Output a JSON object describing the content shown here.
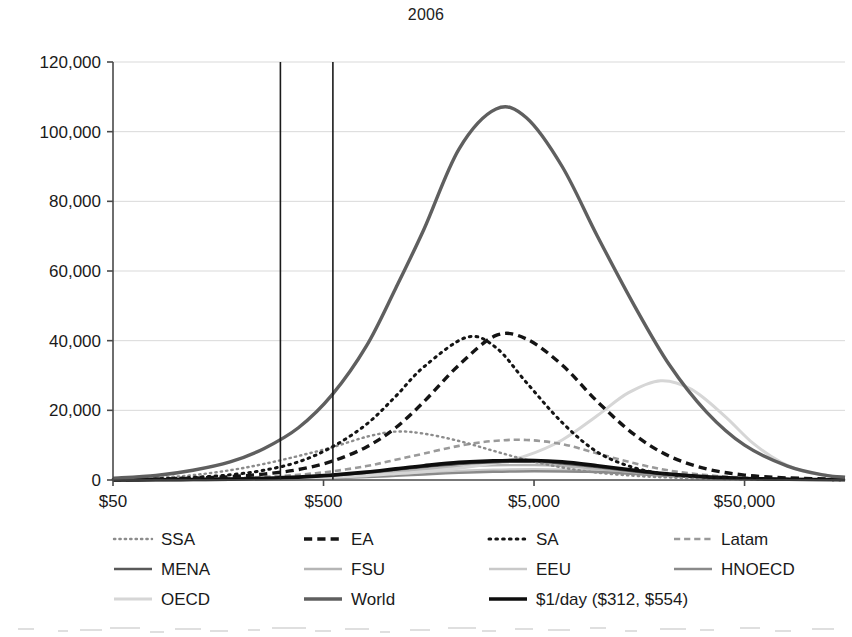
{
  "chart_data": {
    "type": "line",
    "title": "2006",
    "xlabel": "",
    "ylabel": "",
    "x_scale": "log",
    "xlim": [
      50,
      150000
    ],
    "ylim": [
      0,
      120000
    ],
    "grid": "horizontal",
    "legend_position": "bottom",
    "x_tick_labels": [
      "$50",
      "$500",
      "$5,000",
      "$50,000"
    ],
    "x_tick_values": [
      50,
      500,
      5000,
      50000
    ],
    "y_tick_labels": [
      "0",
      "20,000",
      "40,000",
      "60,000",
      "80,000",
      "100,000",
      "120,000"
    ],
    "y_tick_values": [
      0,
      20000,
      40000,
      60000,
      80000,
      100000,
      120000
    ],
    "annotations": [
      {
        "name": "poverty-line-low",
        "label": "$312",
        "x": 312,
        "style": "vertical-line",
        "color": "#1a1a1a"
      },
      {
        "name": "poverty-line-high",
        "label": "$554",
        "x": 554,
        "style": "vertical-line",
        "color": "#1a1a1a"
      }
    ],
    "series": [
      {
        "name": "SSA",
        "label": "SSA",
        "style": "dotted",
        "color": "#8c8c8c",
        "width": 2.4,
        "peak_x": 900,
        "peak_y": 14000,
        "points": [
          [
            50,
            200
          ],
          [
            80,
            600
          ],
          [
            120,
            1400
          ],
          [
            180,
            2800
          ],
          [
            260,
            4600
          ],
          [
            380,
            6900
          ],
          [
            550,
            9400
          ],
          [
            800,
            12400
          ],
          [
            1100,
            13900
          ],
          [
            1500,
            13300
          ],
          [
            2200,
            11200
          ],
          [
            3200,
            8400
          ],
          [
            4600,
            5800
          ],
          [
            6800,
            3600
          ],
          [
            10000,
            2100
          ],
          [
            15000,
            1200
          ],
          [
            22000,
            700
          ],
          [
            33000,
            400
          ],
          [
            50000,
            220
          ],
          [
            80000,
            120
          ],
          [
            150000,
            60
          ]
        ]
      },
      {
        "name": "EA",
        "label": "EA",
        "style": "dashed",
        "color": "#141414",
        "width": 3.4,
        "peak_x": 3300,
        "peak_y": 41500,
        "points": [
          [
            50,
            100
          ],
          [
            80,
            250
          ],
          [
            120,
            500
          ],
          [
            180,
            950
          ],
          [
            260,
            1700
          ],
          [
            380,
            3000
          ],
          [
            550,
            5400
          ],
          [
            800,
            9500
          ],
          [
            1100,
            15000
          ],
          [
            1500,
            22500
          ],
          [
            2200,
            33000
          ],
          [
            3300,
            41500
          ],
          [
            4600,
            40500
          ],
          [
            6800,
            33000
          ],
          [
            10000,
            22500
          ],
          [
            15000,
            13000
          ],
          [
            22000,
            6800
          ],
          [
            33000,
            3200
          ],
          [
            50000,
            1400
          ],
          [
            80000,
            600
          ],
          [
            150000,
            200
          ]
        ]
      },
      {
        "name": "SA",
        "label": "SA",
        "style": "dotted",
        "color": "#141414",
        "width": 3.0,
        "peak_x": 2400,
        "peak_y": 41000,
        "points": [
          [
            50,
            150
          ],
          [
            80,
            350
          ],
          [
            120,
            750
          ],
          [
            180,
            1500
          ],
          [
            260,
            2800
          ],
          [
            380,
            5200
          ],
          [
            550,
            9500
          ],
          [
            800,
            16000
          ],
          [
            1100,
            24000
          ],
          [
            1500,
            32500
          ],
          [
            2400,
            41000
          ],
          [
            3300,
            38000
          ],
          [
            4600,
            28000
          ],
          [
            6800,
            16500
          ],
          [
            10000,
            8000
          ],
          [
            15000,
            3500
          ],
          [
            22000,
            1600
          ],
          [
            33000,
            800
          ],
          [
            50000,
            400
          ],
          [
            80000,
            200
          ],
          [
            150000,
            80
          ]
        ]
      },
      {
        "name": "Latam",
        "label": "Latam",
        "style": "dashed",
        "color": "#9a9a9a",
        "width": 2.6,
        "peak_x": 4000,
        "peak_y": 11500,
        "points": [
          [
            50,
            60
          ],
          [
            80,
            140
          ],
          [
            120,
            280
          ],
          [
            180,
            520
          ],
          [
            260,
            900
          ],
          [
            380,
            1500
          ],
          [
            550,
            2500
          ],
          [
            800,
            4000
          ],
          [
            1100,
            5800
          ],
          [
            1500,
            7600
          ],
          [
            2200,
            9800
          ],
          [
            3200,
            11200
          ],
          [
            4600,
            11500
          ],
          [
            6800,
            10300
          ],
          [
            10000,
            7600
          ],
          [
            15000,
            4800
          ],
          [
            22000,
            2700
          ],
          [
            33000,
            1400
          ],
          [
            50000,
            700
          ],
          [
            80000,
            320
          ],
          [
            150000,
            120
          ]
        ]
      },
      {
        "name": "MENA",
        "label": "MENA",
        "style": "solid",
        "color": "#595959",
        "width": 2.4,
        "peak_x": 5000,
        "peak_y": 5200,
        "points": [
          [
            50,
            30
          ],
          [
            80,
            70
          ],
          [
            120,
            140
          ],
          [
            180,
            270
          ],
          [
            260,
            480
          ],
          [
            380,
            820
          ],
          [
            550,
            1350
          ],
          [
            800,
            2100
          ],
          [
            1100,
            2900
          ],
          [
            1500,
            3700
          ],
          [
            2200,
            4600
          ],
          [
            3200,
            5100
          ],
          [
            5000,
            5200
          ],
          [
            6800,
            4700
          ],
          [
            10000,
            3700
          ],
          [
            15000,
            2400
          ],
          [
            22000,
            1400
          ],
          [
            33000,
            750
          ],
          [
            50000,
            380
          ],
          [
            80000,
            170
          ],
          [
            150000,
            70
          ]
        ]
      },
      {
        "name": "FSU",
        "label": "FSU",
        "style": "solid",
        "color": "#b5b5b5",
        "width": 2.4,
        "peak_x": 6000,
        "peak_y": 4300,
        "points": [
          [
            50,
            20
          ],
          [
            80,
            45
          ],
          [
            120,
            95
          ],
          [
            180,
            180
          ],
          [
            260,
            330
          ],
          [
            380,
            580
          ],
          [
            550,
            980
          ],
          [
            800,
            1600
          ],
          [
            1100,
            2300
          ],
          [
            1500,
            3000
          ],
          [
            2200,
            3800
          ],
          [
            3200,
            4200
          ],
          [
            5000,
            4300
          ],
          [
            6800,
            4000
          ],
          [
            10000,
            3200
          ],
          [
            15000,
            2200
          ],
          [
            22000,
            1300
          ],
          [
            33000,
            700
          ],
          [
            50000,
            350
          ],
          [
            80000,
            150
          ],
          [
            150000,
            60
          ]
        ]
      },
      {
        "name": "EEU",
        "label": "EEU",
        "style": "solid",
        "color": "#c9c9c9",
        "width": 2.4,
        "peak_x": 8000,
        "peak_y": 3100,
        "points": [
          [
            50,
            10
          ],
          [
            80,
            25
          ],
          [
            120,
            55
          ],
          [
            180,
            110
          ],
          [
            260,
            210
          ],
          [
            380,
            380
          ],
          [
            550,
            650
          ],
          [
            800,
            1050
          ],
          [
            1100,
            1550
          ],
          [
            1500,
            2050
          ],
          [
            2200,
            2600
          ],
          [
            3200,
            2950
          ],
          [
            5000,
            3100
          ],
          [
            8000,
            2900
          ],
          [
            10000,
            2700
          ],
          [
            15000,
            1900
          ],
          [
            22000,
            1200
          ],
          [
            33000,
            650
          ],
          [
            50000,
            320
          ],
          [
            80000,
            140
          ],
          [
            150000,
            55
          ]
        ]
      },
      {
        "name": "HNOECD",
        "label": "HNOECD",
        "style": "solid",
        "color": "#8a8a8a",
        "width": 2.4,
        "peak_x": 9000,
        "peak_y": 2500,
        "points": [
          [
            50,
            8
          ],
          [
            80,
            18
          ],
          [
            120,
            40
          ],
          [
            180,
            80
          ],
          [
            260,
            155
          ],
          [
            380,
            290
          ],
          [
            550,
            500
          ],
          [
            800,
            830
          ],
          [
            1100,
            1200
          ],
          [
            1500,
            1600
          ],
          [
            2200,
            2050
          ],
          [
            3200,
            2350
          ],
          [
            5000,
            2500
          ],
          [
            9000,
            2350
          ],
          [
            15000,
            1700
          ],
          [
            22000,
            1100
          ],
          [
            33000,
            600
          ],
          [
            50000,
            300
          ],
          [
            80000,
            130
          ],
          [
            150000,
            50
          ]
        ]
      },
      {
        "name": "OECD",
        "label": "OECD",
        "style": "solid",
        "color": "#d6d6d6",
        "width": 3.0,
        "peak_x": 20000,
        "peak_y": 28500,
        "points": [
          [
            50,
            20
          ],
          [
            80,
            40
          ],
          [
            120,
            80
          ],
          [
            180,
            150
          ],
          [
            260,
            280
          ],
          [
            380,
            480
          ],
          [
            550,
            800
          ],
          [
            800,
            1250
          ],
          [
            1100,
            1800
          ],
          [
            1500,
            2400
          ],
          [
            2200,
            3400
          ],
          [
            3200,
            4800
          ],
          [
            4600,
            7000
          ],
          [
            6800,
            11500
          ],
          [
            10000,
            18500
          ],
          [
            14000,
            25000
          ],
          [
            20000,
            28500
          ],
          [
            28000,
            26000
          ],
          [
            40000,
            18500
          ],
          [
            55000,
            10500
          ],
          [
            75000,
            5000
          ],
          [
            100000,
            2200
          ],
          [
            150000,
            700
          ]
        ]
      },
      {
        "name": "World",
        "label": "World",
        "style": "solid",
        "color": "#5f5f5f",
        "width": 3.4,
        "peak_x": 3300,
        "peak_y": 106500,
        "points": [
          [
            50,
            500
          ],
          [
            80,
            1300
          ],
          [
            120,
            2800
          ],
          [
            180,
            5200
          ],
          [
            260,
            9000
          ],
          [
            380,
            15000
          ],
          [
            550,
            24500
          ],
          [
            800,
            38500
          ],
          [
            1100,
            55000
          ],
          [
            1500,
            72000
          ],
          [
            2200,
            95000
          ],
          [
            3300,
            106500
          ],
          [
            4600,
            104000
          ],
          [
            6800,
            90000
          ],
          [
            10000,
            70000
          ],
          [
            15000,
            50000
          ],
          [
            22000,
            33000
          ],
          [
            33000,
            19500
          ],
          [
            50000,
            10000
          ],
          [
            80000,
            4000
          ],
          [
            120000,
            1400
          ],
          [
            150000,
            800
          ]
        ]
      },
      {
        "name": "$1/day ($312, $554)",
        "label": "$1/day ($312, $554)",
        "style": "solid-thick",
        "color": "#0d0d0d",
        "width": 3.6,
        "peak_x": 5000,
        "peak_y": 5600,
        "points": [
          [
            50,
            25
          ],
          [
            80,
            60
          ],
          [
            120,
            130
          ],
          [
            180,
            260
          ],
          [
            260,
            470
          ],
          [
            380,
            820
          ],
          [
            550,
            1400
          ],
          [
            800,
            2250
          ],
          [
            1100,
            3200
          ],
          [
            1500,
            4100
          ],
          [
            2200,
            5050
          ],
          [
            3200,
            5500
          ],
          [
            5000,
            5600
          ],
          [
            6800,
            5200
          ],
          [
            10000,
            4100
          ],
          [
            15000,
            2800
          ],
          [
            22000,
            1700
          ],
          [
            33000,
            900
          ],
          [
            50000,
            450
          ],
          [
            80000,
            200
          ],
          [
            150000,
            80
          ]
        ]
      }
    ]
  },
  "legend": {
    "rows": [
      [
        {
          "name": "legend-ssa",
          "label": "SSA"
        },
        {
          "name": "legend-ea",
          "label": "EA"
        },
        {
          "name": "legend-sa",
          "label": "SA"
        },
        {
          "name": "legend-latam",
          "label": "Latam"
        }
      ],
      [
        {
          "name": "legend-mena",
          "label": "MENA"
        },
        {
          "name": "legend-fsu",
          "label": "FSU"
        },
        {
          "name": "legend-eeu",
          "label": "EEU"
        },
        {
          "name": "legend-hnoecd",
          "label": "HNOECD"
        }
      ],
      [
        {
          "name": "legend-oecd",
          "label": "OECD"
        },
        {
          "name": "legend-world",
          "label": "World"
        },
        {
          "name": "legend-dollar-day",
          "label": "$1/day ($312, $554)"
        }
      ]
    ]
  },
  "colors": {
    "axis": "#4a4a4a",
    "grid": "#d9d9d9",
    "text": "#1a1a1a",
    "background": "#ffffff"
  }
}
